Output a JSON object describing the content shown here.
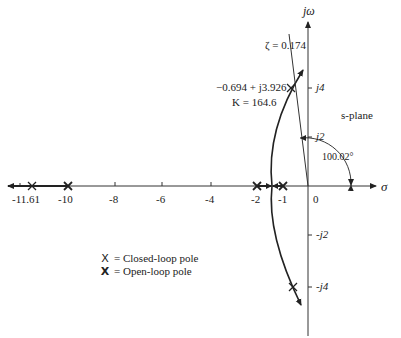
{
  "figure": {
    "type": "root-locus",
    "plane_label": "s-plane",
    "axes": {
      "x_label": "σ",
      "y_label": "jω",
      "x_ticks": [
        "-11.61",
        "-10",
        "-8",
        "-6",
        "-4",
        "-2",
        "-1",
        "0"
      ],
      "y_ticks": [
        "j4",
        "j2",
        "-j2",
        "-j4"
      ]
    },
    "annotations": {
      "zeta": "ζ = 0.174",
      "point": "−0.694 + j3.926",
      "gain": "K = 164.6",
      "angle": "100.02°"
    },
    "legend": [
      {
        "marker": "X",
        "label": "= Closed-loop pole",
        "style": "closed-loop"
      },
      {
        "marker": "X",
        "label": "= Open-loop pole",
        "style": "open-loop"
      }
    ],
    "open_loop_poles": [
      -10,
      -2,
      -1
    ],
    "closed_loop_poles": [
      "-11.61",
      "-0.694+j3.926",
      "-0.694-j3.926"
    ],
    "colors": {
      "line": "#222222",
      "axis": "#333333",
      "text": "#222222"
    }
  }
}
